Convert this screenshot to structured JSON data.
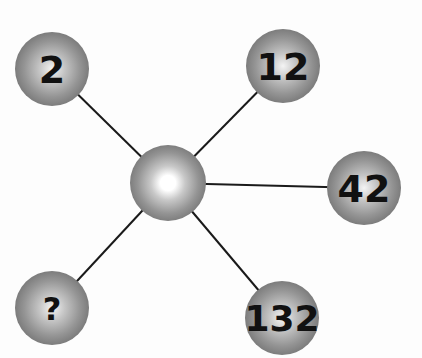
{
  "diagram": {
    "center": {
      "x": 168,
      "y": 183,
      "r": 38,
      "label": ""
    },
    "nodes": [
      {
        "id": "node-2",
        "label": "2",
        "x": 52,
        "y": 69,
        "r": 37,
        "font_size": 38
      },
      {
        "id": "node-12",
        "label": "12",
        "x": 283,
        "y": 66,
        "r": 37,
        "font_size": 38
      },
      {
        "id": "node-42",
        "label": "42",
        "x": 364,
        "y": 188,
        "r": 37,
        "font_size": 38
      },
      {
        "id": "node-question",
        "label": "?",
        "x": 52,
        "y": 308,
        "r": 37,
        "font_size": 32
      },
      {
        "id": "node-132",
        "label": "132",
        "x": 282,
        "y": 318,
        "r": 37,
        "font_size": 36
      }
    ],
    "colors": {
      "background": "#fdfdfd",
      "line": "#1a1a1a",
      "sphere_dark": "#7a7a7a",
      "sphere_mid": "#a8a8a8",
      "sphere_light": "#ffffff",
      "text": "#111111"
    }
  }
}
